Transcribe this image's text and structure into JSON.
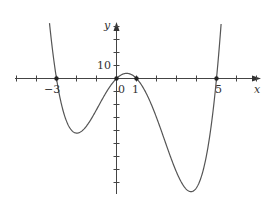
{
  "chart_data": {
    "type": "line",
    "title": "",
    "function": "y = x(x+3)(x-1)(x-5)",
    "xlabel": "x",
    "ylabel": "y",
    "xlim": [
      -4.1,
      7.2
    ],
    "ylim": [
      -90,
      42
    ],
    "x_tick_labels": [
      "-3",
      "0",
      "1",
      "5"
    ],
    "y_tick_labels": [
      "10"
    ],
    "marked_points": [
      {
        "x": -3,
        "y": 0
      },
      {
        "x": 0,
        "y": 0
      },
      {
        "x": 1,
        "y": 0
      },
      {
        "x": 5,
        "y": 0
      }
    ],
    "local_extrema": [
      {
        "x": -1.9,
        "y": -42,
        "kind": "min"
      },
      {
        "x": 0.5,
        "y": 4,
        "kind": "max"
      },
      {
        "x": 3.9,
        "y": -84,
        "kind": "min"
      }
    ],
    "grid": false,
    "legend": "none"
  },
  "labels": {
    "x_axis": "x",
    "y_axis": "y",
    "tick_neg3": "−3",
    "tick_0": "0",
    "tick_1": "1",
    "tick_5": "5",
    "tick_y10": "10"
  }
}
